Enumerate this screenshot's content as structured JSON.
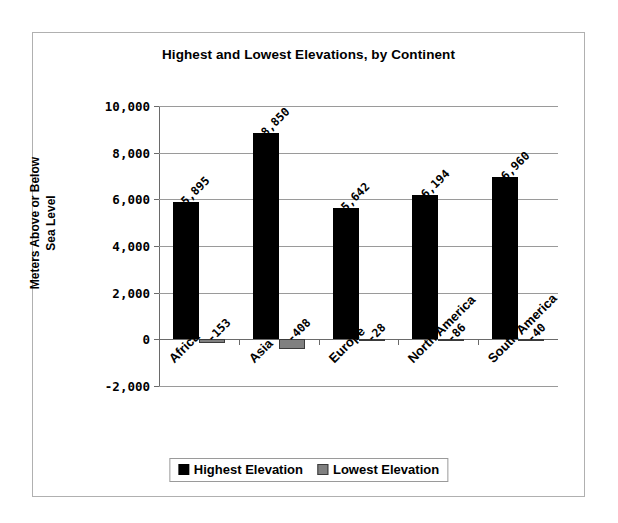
{
  "chart_data": {
    "type": "bar",
    "title": "Highest and Lowest Elevations, by Continent",
    "xlabel": "",
    "ylabel": "Meters Above or Below Sea Level",
    "ylabel_line1": "Meters Above or Below",
    "ylabel_line2": "Sea Level",
    "categories": [
      "Africa",
      "Asia",
      "Europe",
      "North America",
      "South America"
    ],
    "series": [
      {
        "name": "Highest Elevation",
        "color": "#000000",
        "values": [
          5895,
          8850,
          5642,
          6194,
          6960
        ],
        "labels": [
          "5,895",
          "8,850",
          "5,642",
          "6,194",
          "6,960"
        ]
      },
      {
        "name": "Lowest Elevation",
        "color": "#808080",
        "values": [
          -153,
          -408,
          -28,
          -86,
          -40
        ],
        "labels": [
          "-153",
          "-408",
          "-28",
          "-86",
          "-40"
        ]
      }
    ],
    "ylim": [
      -2000,
      10000
    ],
    "yticks": [
      10000,
      8000,
      6000,
      4000,
      2000,
      0,
      -2000
    ],
    "ytick_labels": [
      "10,000",
      "8,000",
      "6,000",
      "4,000",
      "2,000",
      "0",
      "-2,000"
    ],
    "grid": true,
    "legend_position": "bottom-center",
    "legend": [
      "Highest Elevation",
      "Lowest Elevation"
    ]
  }
}
